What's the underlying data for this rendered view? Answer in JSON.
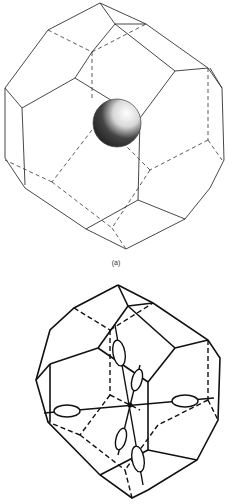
{
  "figure": {
    "panel_a": {
      "description": "Truncated octahedron (wireframe) with a shaded sphere at its center",
      "caption": "(a)"
    },
    "panel_b": {
      "description": "Truncated octahedron (wireframe, bold) with ellipsoidal orbitals along axes toward hexagonal faces",
      "caption": ""
    }
  },
  "colors": {
    "line": "#222222",
    "sphere_dark": "#1a1a1a",
    "background": "#ffffff"
  }
}
